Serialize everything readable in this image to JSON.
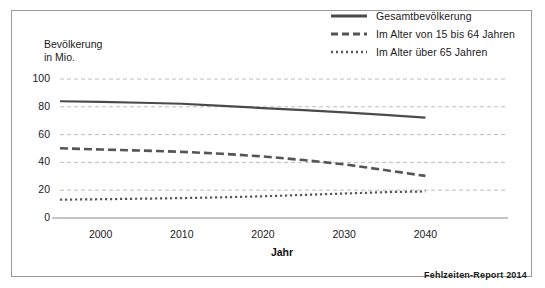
{
  "figure": {
    "credit": "Fehlzeiten-Report 2014",
    "border_color": "#9a9a9a"
  },
  "axes": {
    "y_title_line1": "Bevölkerung",
    "y_title_line2": "in Mio.",
    "x_title": "Jahr"
  },
  "chart_data": {
    "type": "line",
    "title": "",
    "subtitle": "",
    "xlabel": "Jahr",
    "ylabel": "Bevölkerung in Mio.",
    "xlim": [
      1995,
      2045
    ],
    "ylim": [
      0,
      100
    ],
    "xticks": [
      2000,
      2010,
      2020,
      2030,
      2040
    ],
    "xtick_labels": [
      "2000",
      "2010",
      "2020",
      "2030",
      "2040"
    ],
    "yticks": [
      0,
      20,
      40,
      60,
      80,
      100
    ],
    "ytick_labels": [
      "0",
      "20",
      "40",
      "60",
      "80",
      "100"
    ],
    "grid": true,
    "grid_style": "dashed",
    "grid_color": "#b5b5b5",
    "legend_position": "top-right",
    "x": [
      1995,
      2000,
      2005,
      2010,
      2015,
      2020,
      2025,
      2030,
      2035,
      2040
    ],
    "series": [
      {
        "name": "Gesamtbevölkerung",
        "style": "solid",
        "color": "#4a4a4a",
        "width": 2.2,
        "values": [
          84,
          83.5,
          82.9,
          82.2,
          80.6,
          79.1,
          77.6,
          76.0,
          74.2,
          72.2
        ]
      },
      {
        "name": "Im Alter von 15 bis 64 Jahren",
        "style": "dashed",
        "color": "#555555",
        "width": 2.6,
        "values": [
          50.2,
          49.3,
          48.5,
          47.6,
          46.2,
          44.3,
          41.7,
          38.6,
          34.5,
          30.3
        ]
      },
      {
        "name": "Im Alter über 65 Jahren",
        "style": "dotted",
        "color": "#555555",
        "width": 2.2,
        "values": [
          13.2,
          13.5,
          13.9,
          14.3,
          14.9,
          15.6,
          16.6,
          17.6,
          18.6,
          19.1
        ]
      }
    ]
  }
}
